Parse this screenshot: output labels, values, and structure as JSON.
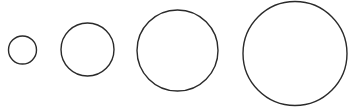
{
  "diagram": {
    "background": "#ffffff",
    "stroke_color": "#2a2a2a",
    "stroke_width": 1.4,
    "circles": [
      {
        "cx": 22.5,
        "cy": 50,
        "r": 14
      },
      {
        "cx": 87.5,
        "cy": 49.5,
        "r": 26.5
      },
      {
        "cx": 177.5,
        "cy": 50.5,
        "r": 40.5
      },
      {
        "cx": 295,
        "cy": 53.5,
        "r": 52
      }
    ]
  }
}
